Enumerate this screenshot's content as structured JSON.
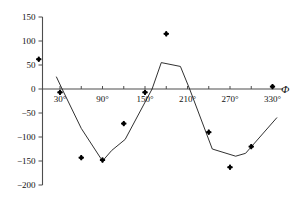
{
  "chart_data": {
    "type": "scatter",
    "title": "",
    "subtitle": "",
    "xlabel": "Φ",
    "ylabel": "",
    "xlim": [
      0,
      345
    ],
    "ylim": [
      -200,
      150
    ],
    "grid": false,
    "legend": null,
    "x_tick_labels": [
      "30°",
      "90°",
      "150°",
      "210°",
      "270°",
      "330°"
    ],
    "x_tick_values": [
      30,
      90,
      150,
      210,
      270,
      330
    ],
    "x_minor_tick_values": [
      60,
      120,
      180,
      240,
      300
    ],
    "y_tick_labels": [
      "150",
      "100",
      "50",
      "0",
      "−50",
      "−100",
      "−150",
      "−200"
    ],
    "y_tick_values": [
      150,
      100,
      50,
      0,
      -50,
      -100,
      -150,
      -200
    ],
    "series": [
      {
        "name": "measured",
        "type": "scatter",
        "marker": "diamond",
        "color": "#000000",
        "points": [
          {
            "x": 0,
            "y": 62
          },
          {
            "x": 30,
            "y": -7
          },
          {
            "x": 60,
            "y": -143
          },
          {
            "x": 90,
            "y": -148
          },
          {
            "x": 120,
            "y": -72
          },
          {
            "x": 150,
            "y": -7
          },
          {
            "x": 180,
            "y": 115
          },
          {
            "x": 240,
            "y": -90
          },
          {
            "x": 270,
            "y": -163
          },
          {
            "x": 300,
            "y": -120
          },
          {
            "x": 330,
            "y": 5
          }
        ]
      },
      {
        "name": "model",
        "type": "line",
        "color": "#1a1a1a",
        "points": [
          {
            "x": 25,
            "y": 25
          },
          {
            "x": 33,
            "y": 0
          },
          {
            "x": 60,
            "y": -82
          },
          {
            "x": 90,
            "y": -150
          },
          {
            "x": 103,
            "y": -128
          },
          {
            "x": 122,
            "y": -105
          },
          {
            "x": 160,
            "y": 0
          },
          {
            "x": 173,
            "y": 55
          },
          {
            "x": 200,
            "y": 47
          },
          {
            "x": 213,
            "y": 0
          },
          {
            "x": 245,
            "y": -125
          },
          {
            "x": 278,
            "y": -140
          },
          {
            "x": 292,
            "y": -134
          },
          {
            "x": 336,
            "y": -60
          }
        ]
      }
    ]
  }
}
